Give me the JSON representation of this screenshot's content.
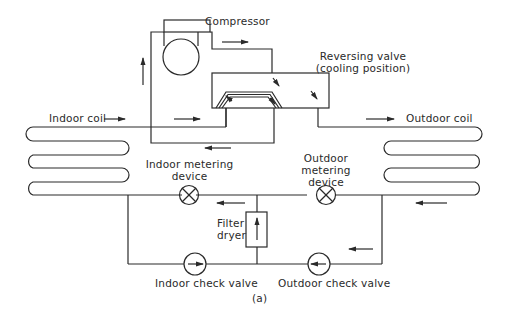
{
  "diagram": {
    "type": "heat pump refrigerant circuit (cooling mode)",
    "caption": "(a)",
    "labels": {
      "compressor": "Compressor",
      "reversing_valve_line1": "Reversing valve",
      "reversing_valve_line2": "(cooling position)",
      "indoor_coil": "Indoor coil",
      "outdoor_coil": "Outdoor coil",
      "indoor_metering_line1": "Indoor metering",
      "indoor_metering_line2": "device",
      "outdoor_metering_line1": "Outdoor",
      "outdoor_metering_line2": "metering",
      "outdoor_metering_line3": "device",
      "filter_dryer_line1": "Filter",
      "filter_dryer_line2": "dryer",
      "indoor_check_valve": "Indoor check valve",
      "outdoor_check_valve": "Outdoor check valve"
    },
    "components": [
      {
        "id": "compressor",
        "icon": "compressor-circle-icon"
      },
      {
        "id": "reversing-valve",
        "icon": "reversing-valve-icon"
      },
      {
        "id": "indoor-coil",
        "icon": "coil-icon"
      },
      {
        "id": "outdoor-coil",
        "icon": "coil-icon"
      },
      {
        "id": "indoor-metering-device",
        "icon": "metering-valve-x-icon"
      },
      {
        "id": "outdoor-metering-device",
        "icon": "metering-valve-x-icon"
      },
      {
        "id": "filter-dryer",
        "icon": "filter-dryer-icon"
      },
      {
        "id": "indoor-check-valve",
        "icon": "check-valve-icon"
      },
      {
        "id": "outdoor-check-valve",
        "icon": "check-valve-icon"
      }
    ],
    "colors": {
      "line": "#2a2a2a",
      "background": "#ffffff"
    }
  }
}
